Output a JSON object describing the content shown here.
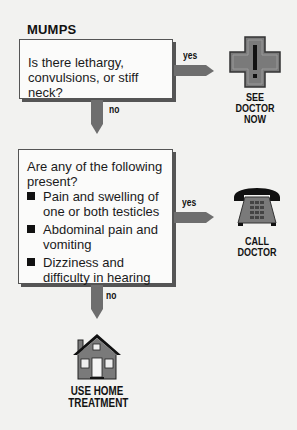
{
  "title": "MUMPS",
  "step1": {
    "question": "Is there lethargy, convulsions, or stiff neck?",
    "yes_label": "yes",
    "no_label": "no",
    "yes_outcome": {
      "icon": "medical-cross-icon",
      "line1": "SEE",
      "line2": "DOCTOR",
      "line3": "NOW"
    }
  },
  "step2": {
    "question": "Are any of the following present?",
    "items": [
      "Pain and swelling of one or both testicles",
      "Abdominal pain and vomiting",
      "Dizziness and difficulty in hearing"
    ],
    "yes_label": "yes",
    "no_label": "no",
    "yes_outcome": {
      "icon": "telephone-icon",
      "line1": "CALL",
      "line2": "DOCTOR"
    },
    "no_outcome": {
      "icon": "house-icon",
      "line1": "USE HOME",
      "line2": "TREATMENT"
    }
  },
  "colors": {
    "arrow": "#6e6e6e",
    "icon_gray": "#7a7a7a",
    "box_border": "#555555"
  }
}
